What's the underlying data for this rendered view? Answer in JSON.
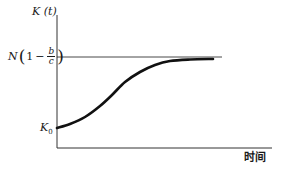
{
  "chart_data": {
    "type": "line",
    "title": "",
    "xlabel": "时间",
    "ylabel": "K (t)",
    "y_tick_labels": [
      {
        "label": "N(1 − b/c)",
        "role": "asymptote"
      },
      {
        "label": "K₀",
        "role": "initial-value"
      }
    ],
    "series": [
      {
        "name": "K(t) logistic growth",
        "shape": "S-curve rising from K₀ approaching N(1 − b/c)",
        "points_px": [
          [
            57,
            128
          ],
          [
            70,
            124
          ],
          [
            85,
            117
          ],
          [
            100,
            106
          ],
          [
            112,
            95
          ],
          [
            125,
            82
          ],
          [
            140,
            72
          ],
          [
            155,
            65
          ],
          [
            170,
            61
          ],
          [
            190,
            59.5
          ],
          [
            213,
            59
          ]
        ]
      }
    ],
    "asymptote": {
      "label": "N(1 − b/c)",
      "y_px": 57,
      "x_start_px": 57,
      "x_end_px": 222
    },
    "axes": {
      "origin_px": [
        57,
        148
      ],
      "y_top_px": 15,
      "x_right_px": 272
    },
    "grid": false,
    "legend": null
  },
  "labels": {
    "y_axis": "K (t)",
    "x_axis": "时间",
    "asymptote": {
      "prefix": "N",
      "one": "1",
      "minus": "−",
      "frac_num": "b",
      "frac_den": "c"
    },
    "k0": {
      "base": "K",
      "sub": "0"
    }
  },
  "colors": {
    "ink": "#1a1a1a",
    "axis": "#333333",
    "background": "#ffffff"
  }
}
